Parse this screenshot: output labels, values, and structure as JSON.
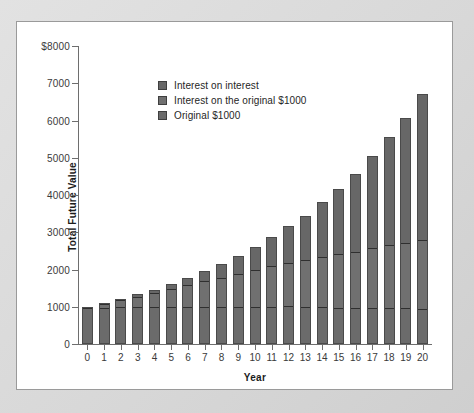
{
  "chart_data": {
    "type": "bar",
    "subtype": "stacked-bar",
    "title": "",
    "xlabel": "Year",
    "ylabel": "Total Future Value",
    "categories": [
      "0",
      "1",
      "2",
      "3",
      "4",
      "5",
      "6",
      "7",
      "8",
      "9",
      "10",
      "11",
      "12",
      "13",
      "14",
      "15",
      "16",
      "17",
      "18",
      "19",
      "20"
    ],
    "x": [
      0,
      1,
      2,
      3,
      4,
      5,
      6,
      7,
      8,
      9,
      10,
      11,
      12,
      13,
      14,
      15,
      16,
      17,
      18,
      19,
      20
    ],
    "ylim": [
      0,
      8000
    ],
    "yticks": [
      0,
      1000,
      2000,
      3000,
      4000,
      5000,
      6000,
      7000,
      8000
    ],
    "ytick_labels": [
      "0",
      "1000",
      "2000",
      "3000",
      "4000",
      "5000",
      "6000",
      "7000",
      "$8000"
    ],
    "grid": false,
    "legend_position": "upper-left-inside",
    "series": [
      {
        "name": "Original $1000",
        "color": "#6b6b6b",
        "values": [
          1000,
          1000,
          1000,
          1000,
          1000,
          1000,
          1000,
          1000,
          1000,
          1000,
          1000,
          1000,
          1000,
          1000,
          1000,
          1000,
          1000,
          1000,
          1000,
          1000,
          1000
        ]
      },
      {
        "name": "Interest on the original $1000",
        "color": "#707070",
        "values": [
          0,
          100,
          200,
          300,
          400,
          500,
          600,
          700,
          800,
          900,
          1000,
          1100,
          1200,
          1300,
          1400,
          1500,
          1600,
          1700,
          1800,
          1900,
          2000
        ]
      },
      {
        "name": "Interest on interest",
        "color": "#676767",
        "values": [
          0,
          0,
          10,
          31,
          64,
          110,
          172,
          251,
          349,
          469,
          613,
          784,
          986,
          1222,
          1495,
          1811,
          2173,
          2588,
          3060,
          3595,
          4200
        ]
      }
    ],
    "totals": [
      1000,
      1100,
      1210,
      1331,
      1464,
      1610,
      1772,
      1949,
      2144,
      2369,
      2613,
      2884,
      3186,
      3522,
      3895,
      4311,
      4773,
      5288,
      5860,
      6495,
      7200
    ],
    "totals_plotted": [
      1000,
      1100,
      1210,
      1330,
      1460,
      1610,
      1770,
      1950,
      2150,
      2370,
      2610,
      2880,
      3180,
      3450,
      3800,
      4160,
      4560,
      5050,
      5550,
      6080,
      6700
    ]
  },
  "legend": {
    "items": [
      {
        "label": "Interest on interest",
        "color": "#676767"
      },
      {
        "label": "Interest on the original $1000",
        "color": "#707070"
      },
      {
        "label": "Original $1000",
        "color": "#6b6b6b"
      }
    ]
  },
  "axes": {
    "y_title": "Total Future Value",
    "x_title": "Year"
  }
}
